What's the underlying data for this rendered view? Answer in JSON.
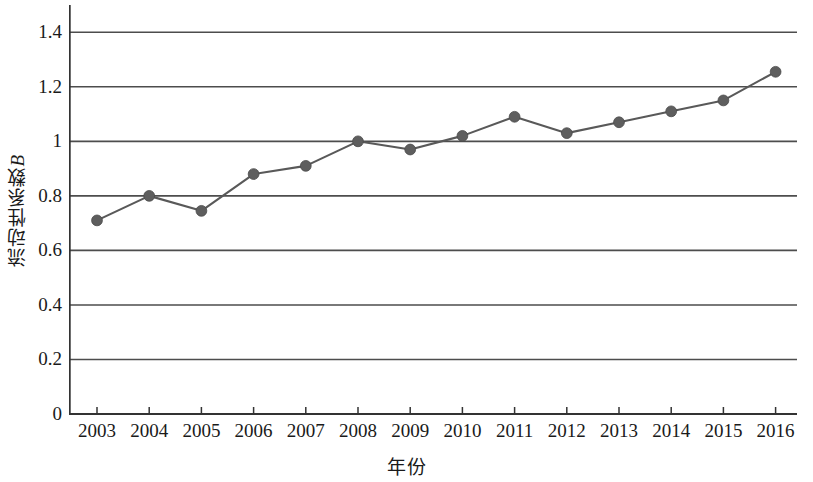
{
  "chart_data": {
    "type": "line",
    "title": "",
    "subtitle": "",
    "xlabel": "年份",
    "ylabel": "流动性系数B",
    "ylabel_cjk": "流动性系数",
    "ylabel_latin": "B",
    "categories": [
      "2003",
      "2004",
      "2005",
      "2006",
      "2007",
      "2008",
      "2009",
      "2010",
      "2011",
      "2012",
      "2013",
      "2014",
      "2015",
      "2016"
    ],
    "x": [
      2003,
      2004,
      2005,
      2006,
      2007,
      2008,
      2009,
      2010,
      2011,
      2012,
      2013,
      2014,
      2015,
      2016
    ],
    "values": [
      0.71,
      0.8,
      0.745,
      0.88,
      0.91,
      1.0,
      0.97,
      1.02,
      1.09,
      1.03,
      1.07,
      1.11,
      1.15,
      1.255
    ],
    "series": [
      {
        "name": "流动性系数B",
        "values": [
          0.71,
          0.8,
          0.745,
          0.88,
          0.91,
          1.0,
          0.97,
          1.02,
          1.09,
          1.03,
          1.07,
          1.11,
          1.15,
          1.255
        ]
      }
    ],
    "ylim": [
      0,
      1.5
    ],
    "ytick_labels": [
      "0",
      "0.2",
      "0.4",
      "0.6",
      "0.8",
      "1",
      "1.2",
      "1.4"
    ],
    "yticks": [
      0,
      0.2,
      0.4,
      0.6,
      0.8,
      1.0,
      1.2,
      1.4
    ],
    "grid": "horizontal",
    "legend": "none",
    "line_color": "#595959",
    "marker_color": "#5e5e5e",
    "axis_color": "#333333",
    "grid_color": "#4d4d4d",
    "marker": "circle",
    "annotations": []
  }
}
